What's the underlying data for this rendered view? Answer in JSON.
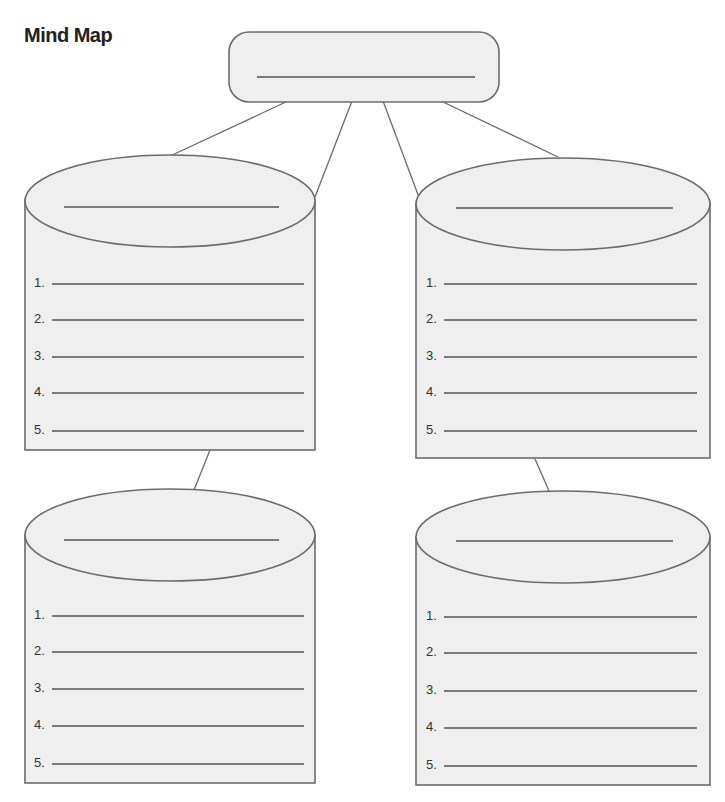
{
  "title": "Mind Map",
  "central_topic": {
    "label": "",
    "line": "blank"
  },
  "nodes": [
    {
      "id": "top-left",
      "heading": "",
      "items": [
        "1.",
        "2.",
        "3.",
        "4.",
        "5."
      ]
    },
    {
      "id": "top-right",
      "heading": "",
      "items": [
        "1.",
        "2.",
        "3.",
        "4.",
        "5."
      ]
    },
    {
      "id": "bottom-left",
      "heading": "",
      "items": [
        "1.",
        "2.",
        "3.",
        "4.",
        "5."
      ]
    },
    {
      "id": "bottom-right",
      "heading": "",
      "items": [
        "1.",
        "2.",
        "3.",
        "4.",
        "5."
      ]
    }
  ],
  "colors": {
    "fill": "#efefef",
    "stroke": "#6b6b6b",
    "line": "#555555",
    "text": "#333333"
  }
}
